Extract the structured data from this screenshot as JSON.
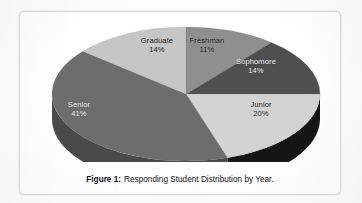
{
  "figure": {
    "caption_label": "Figure 1:",
    "caption_text": "Responding Student Distribution by Year.",
    "frame_border_color": "#d9d9d9",
    "background_color": "#fefefe"
  },
  "chart_data": {
    "type": "pie",
    "title": "Responding Student Distribution by Year",
    "subtitle": "",
    "xlabel": "",
    "ylabel": "",
    "style": "3d-exploded-none",
    "legend_position": "none",
    "labels_inside": true,
    "grid": false,
    "value_unit": "%",
    "start_angle_deg": 0,
    "direction": "clockwise",
    "categories": [
      "Freshman",
      "Sophomore",
      "Junior",
      "Senior",
      "Graduate"
    ],
    "values": [
      11,
      14,
      20,
      41,
      14
    ],
    "slices": [
      {
        "label": "Freshman",
        "percent_text": "11%",
        "value": 11,
        "top_color": "#8f8f8f",
        "side_color": "#5b5b5b",
        "label_on_dark": false
      },
      {
        "label": "Sophomore",
        "percent_text": "14%",
        "value": 14,
        "top_color": "#4f4f4f",
        "side_color": "#2e2e2e",
        "label_on_dark": true
      },
      {
        "label": "Junior",
        "percent_text": "20%",
        "value": 20,
        "top_color": "#d3d3d3",
        "side_color": "#151515",
        "label_on_dark": false
      },
      {
        "label": "Senior",
        "percent_text": "41%",
        "value": 41,
        "top_color": "#6d6d6d",
        "side_color": "#4a4a4a",
        "label_on_dark": true
      },
      {
        "label": "Graduate",
        "percent_text": "14%",
        "value": 14,
        "top_color": "#c6c6c6",
        "side_color": "#8a8a8a",
        "label_on_dark": false
      }
    ]
  }
}
